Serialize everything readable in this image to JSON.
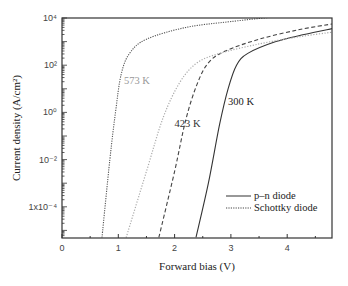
{
  "chart_data": {
    "type": "line",
    "title": "",
    "xlabel": "Forward bias (V)",
    "ylabel": "Current density (A/cm²)",
    "xlim": [
      0,
      4.8
    ],
    "ylim_log10": [
      -5.3,
      4
    ],
    "yscale": "log",
    "x_ticks": [
      0,
      1,
      2,
      3,
      4
    ],
    "x_tick_labels": [
      "0",
      "1",
      "2",
      "3",
      "4"
    ],
    "y_ticks_log10": [
      4,
      2,
      0,
      -2,
      -4
    ],
    "y_tick_labels": [
      "10⁴",
      "10²",
      "10⁰",
      "10⁻²",
      "1x10⁻⁴"
    ],
    "grid": false,
    "legend_position": "lower right",
    "legend": [
      {
        "label": "p–n diode",
        "style": "solid"
      },
      {
        "label": "Schottky diode",
        "style": "dotted"
      }
    ],
    "annotations": [
      {
        "text": "573 K",
        "x": 1.1,
        "log10y": 1.2,
        "color": "#999999"
      },
      {
        "text": "423 K",
        "x": 2.0,
        "log10y": -0.6,
        "color": "#333333"
      },
      {
        "text": "300 K",
        "x": 2.95,
        "log10y": 0.3,
        "color": "#222222"
      }
    ],
    "series": [
      {
        "name": "p–n diode 300 K",
        "style": "solid",
        "color": "#333333",
        "points": [
          [
            2.38,
            -5.3
          ],
          [
            2.6,
            -3.0
          ],
          [
            2.8,
            -0.5
          ],
          [
            2.95,
            1.0
          ],
          [
            3.1,
            2.0
          ],
          [
            3.3,
            2.5
          ],
          [
            3.8,
            3.0
          ],
          [
            4.3,
            3.3
          ],
          [
            4.8,
            3.55
          ]
        ]
      },
      {
        "name": "p–n diode 423 K",
        "style": "dashed",
        "color": "#444444",
        "points": [
          [
            1.72,
            -5.3
          ],
          [
            2.0,
            -2.5
          ],
          [
            2.2,
            -0.3
          ],
          [
            2.4,
            1.2
          ],
          [
            2.6,
            2.1
          ],
          [
            2.9,
            2.6
          ],
          [
            3.5,
            3.1
          ],
          [
            4.2,
            3.5
          ],
          [
            4.8,
            3.75
          ]
        ]
      },
      {
        "name": "p–n diode 573 K",
        "style": "dotted-light",
        "color": "#aaaaaa",
        "points": [
          [
            1.14,
            -5.3
          ],
          [
            1.5,
            -2.5
          ],
          [
            1.8,
            -0.2
          ],
          [
            2.1,
            1.3
          ],
          [
            2.4,
            2.1
          ],
          [
            2.8,
            2.5
          ],
          [
            3.5,
            2.9
          ],
          [
            4.2,
            3.2
          ],
          [
            4.8,
            3.4
          ]
        ]
      },
      {
        "name": "Schottky diode",
        "style": "dotted",
        "color": "#555555",
        "points": [
          [
            0.71,
            -5.3
          ],
          [
            0.85,
            -2.0
          ],
          [
            0.95,
            0.0
          ],
          [
            1.05,
            1.6
          ],
          [
            1.2,
            2.5
          ],
          [
            1.5,
            3.1
          ],
          [
            2.2,
            3.6
          ],
          [
            3.0,
            3.85
          ],
          [
            4.0,
            4.1
          ]
        ]
      }
    ]
  }
}
